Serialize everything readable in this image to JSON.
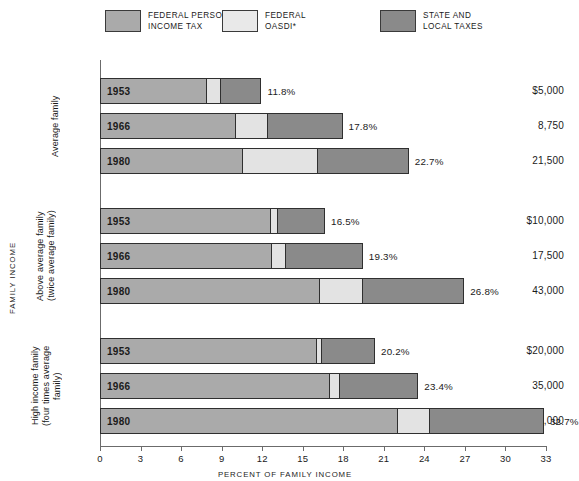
{
  "legend": {
    "items": [
      {
        "label": "FEDERAL PERSONAL\nINCOME TAX",
        "color": "#aaaaaa",
        "icon": "legend-swatch-icon"
      },
      {
        "label": "FEDERAL\nOASDI*",
        "color": "#e3e3e3",
        "icon": "legend-swatch-icon"
      },
      {
        "label": "STATE AND\nLOCAL TAXES",
        "color": "#8a8a8a",
        "icon": "legend-swatch-icon"
      }
    ]
  },
  "axis": {
    "x_title": "PERCENT OF FAMILY INCOME",
    "y_title": "FAMILY INCOME",
    "x_ticks": [
      "0",
      "3",
      "6",
      "9",
      "12",
      "15",
      "18",
      "21",
      "24",
      "27",
      "30",
      "33"
    ]
  },
  "groups": [
    {
      "name": "Average family",
      "rows": [
        {
          "income": "$5,000",
          "year": "1953",
          "total": "11.8%"
        },
        {
          "income": "8,750",
          "year": "1966",
          "total": "17.8%"
        },
        {
          "income": "21,500",
          "year": "1980",
          "total": "22.7%"
        }
      ]
    },
    {
      "name": "Above average family\n(twice average family)",
      "rows": [
        {
          "income": "$10,000",
          "year": "1953",
          "total": "16.5%"
        },
        {
          "income": "17,500",
          "year": "1966",
          "total": "19.3%"
        },
        {
          "income": "43,000",
          "year": "1980",
          "total": "26.8%"
        }
      ]
    },
    {
      "name": "High income family\n(four times average family)",
      "rows": [
        {
          "income": "$20,000",
          "year": "1953",
          "total": "20.2%"
        },
        {
          "income": "35,000",
          "year": "1966",
          "total": "23.4%"
        },
        {
          "income": "86,000",
          "year": "1980",
          "total": "32.7%"
        }
      ]
    }
  ],
  "chart_data": {
    "type": "bar",
    "orientation": "horizontal",
    "stacked": true,
    "title": "",
    "xlabel": "PERCENT OF FAMILY INCOME",
    "ylabel": "FAMILY INCOME",
    "xlim": [
      0,
      33
    ],
    "xticks": [
      0,
      3,
      6,
      9,
      12,
      15,
      18,
      21,
      24,
      27,
      30,
      33
    ],
    "grid": false,
    "legend_position": "top",
    "series": [
      {
        "name": "FEDERAL PERSONAL INCOME TAX",
        "color": "#aaaaaa",
        "values": [
          7.8,
          9.9,
          10.4,
          12.5,
          12.6,
          16.1,
          15.9,
          16.9,
          21.9
        ]
      },
      {
        "name": "FEDERAL OASDI*",
        "color": "#e3e3e3",
        "values": [
          1.0,
          2.4,
          5.6,
          0.5,
          1.0,
          3.2,
          0.4,
          0.7,
          2.4
        ]
      },
      {
        "name": "STATE AND LOCAL TAXES",
        "color": "#8a8a8a",
        "values": [
          3.0,
          5.5,
          6.7,
          3.5,
          5.7,
          7.5,
          3.9,
          5.8,
          8.4
        ]
      }
    ],
    "categories": [
      "Average family 1953 ($5,000)",
      "Average family 1966 (8,750)",
      "Average family 1980 (21,500)",
      "Above average family 1953 ($10,000)",
      "Above average family 1966 (17,500)",
      "Above average family 1980 (43,000)",
      "High income family 1953 ($20,000)",
      "High income family 1966 (35,000)",
      "High income family 1980 (86,000)"
    ],
    "totals": [
      11.8,
      17.8,
      22.7,
      16.5,
      19.3,
      26.8,
      20.2,
      23.4,
      32.7
    ],
    "annotations": [
      "11.8%",
      "17.8%",
      "22.7%",
      "16.5%",
      "19.3%",
      "26.8%",
      "20.2%",
      "23.4%",
      "32.7%"
    ]
  }
}
